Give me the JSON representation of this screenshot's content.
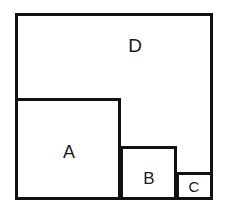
{
  "figure": {
    "canvas": {
      "width": 228,
      "height": 211,
      "background": "#ffffff"
    },
    "stroke_color": "#111111",
    "stroke_width": 3,
    "fill_color": "#ffffff",
    "regions": [
      {
        "id": "D",
        "label": "D",
        "role": "outer-square",
        "x": 15,
        "y": 13,
        "width": 198,
        "height": 187,
        "label_x": 135,
        "label_y": 45
      },
      {
        "id": "A",
        "label": "A",
        "role": "large-inner-square",
        "x": 15,
        "y": 98,
        "width": 106,
        "height": 102,
        "label_x": 69,
        "label_y": 152
      },
      {
        "id": "B",
        "label": "B",
        "role": "medium-inner-square",
        "x": 120,
        "y": 146,
        "width": 57,
        "height": 54,
        "label_x": 149,
        "label_y": 178
      },
      {
        "id": "C",
        "label": "C",
        "role": "small-inner-square",
        "x": 176,
        "y": 172,
        "width": 37,
        "height": 28,
        "label_x": 194,
        "label_y": 186
      }
    ]
  }
}
